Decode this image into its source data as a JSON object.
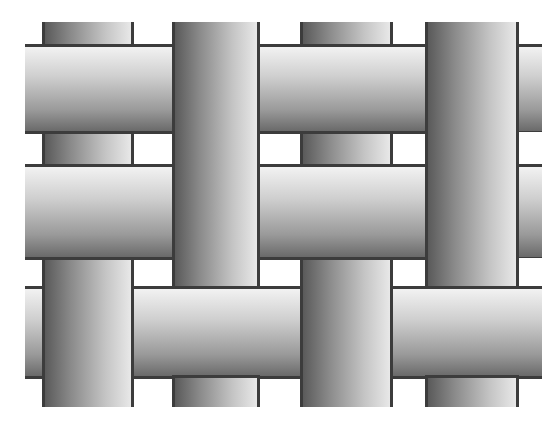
{
  "figure": {
    "colors": {
      "background": "#ffffff",
      "outline": "#3c3c3c",
      "strip_dark": "#5a5a5a",
      "strip_light": "#e8e8e8"
    },
    "columns": [
      {
        "id": "A",
        "x": 42,
        "w": 91
      },
      {
        "id": "B",
        "x": 172,
        "w": 87
      },
      {
        "id": "C",
        "x": 300,
        "w": 92
      },
      {
        "id": "D",
        "x": 425,
        "w": 93
      }
    ],
    "rows": [
      {
        "id": "1",
        "y": 46,
        "h": 86
      },
      {
        "id": "2",
        "y": 166,
        "h": 92
      },
      {
        "id": "3",
        "y": 288,
        "h": 89
      }
    ]
  }
}
